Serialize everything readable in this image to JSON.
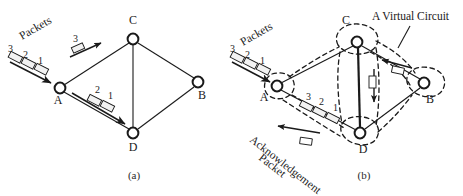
{
  "figure": {
    "title_visible": false,
    "panels": [
      {
        "id": "a",
        "caption": "(a)",
        "nodes": [
          {
            "name": "A",
            "label": "A",
            "cx": 60,
            "cy": 88,
            "lx": 58,
            "ly": 104
          },
          {
            "name": "B",
            "label": "B",
            "cx": 198,
            "cy": 82,
            "lx": 202,
            "ly": 99
          },
          {
            "name": "C",
            "label": "C",
            "cx": 133,
            "cy": 39,
            "lx": 133,
            "ly": 24
          },
          {
            "name": "D",
            "label": "D",
            "cx": 133,
            "cy": 133,
            "lx": 133,
            "ly": 151
          }
        ],
        "edges": [
          {
            "from": "A",
            "to": "C"
          },
          {
            "from": "C",
            "to": "B"
          },
          {
            "from": "A",
            "to": "D"
          },
          {
            "from": "D",
            "to": "B"
          },
          {
            "from": "C",
            "to": "D"
          }
        ],
        "annotations": [
          {
            "name": "packets-label",
            "text": "Packets",
            "x": 22,
            "y": 38,
            "rotate": -30
          }
        ],
        "packet_groups": [
          {
            "name": "packets-inbound-to-a",
            "numbers": [
              "3",
              "2",
              "1"
            ],
            "direction": "toward-A"
          },
          {
            "name": "packet-on-edge-a-c",
            "numbers": [
              "3"
            ],
            "direction": "A-to-C"
          },
          {
            "name": "packets-on-edge-a-d",
            "numbers": [
              "2",
              "1"
            ],
            "direction": "A-to-D"
          }
        ]
      },
      {
        "id": "b",
        "caption": "(b)",
        "nodes": [
          {
            "name": "A",
            "label": "A",
            "cx": 277,
            "cy": 86,
            "lx": 264,
            "ly": 100
          },
          {
            "name": "B",
            "label": "B",
            "cx": 424,
            "cy": 83,
            "lx": 430,
            "ly": 102
          },
          {
            "name": "C",
            "label": "C",
            "cx": 357,
            "cy": 42,
            "lx": 346,
            "ly": 23
          },
          {
            "name": "D",
            "label": "D",
            "cx": 360,
            "cy": 133,
            "lx": 363,
            "ly": 153
          }
        ],
        "edges": [
          {
            "from": "A",
            "to": "C"
          },
          {
            "from": "C",
            "to": "B"
          },
          {
            "from": "A",
            "to": "D"
          },
          {
            "from": "D",
            "to": "B"
          },
          {
            "from": "C",
            "to": "D"
          }
        ],
        "annotations": [
          {
            "name": "virtual-circuit-label",
            "text": "A Virtual Circuit",
            "x": 372,
            "y": 20,
            "rotate": 0
          },
          {
            "name": "packets-label",
            "text": "Packets",
            "x": 243,
            "y": 44,
            "rotate": -30
          },
          {
            "name": "acknowledgement-label-line1",
            "text": "Acknowledgement",
            "x": 248,
            "y": 140,
            "rotate": 38
          },
          {
            "name": "acknowledgement-label-line2",
            "text": "Packet",
            "x": 258,
            "y": 158,
            "rotate": 38
          }
        ],
        "packet_groups": [
          {
            "name": "packets-inbound-to-a",
            "numbers": [
              "3",
              "2",
              "1"
            ],
            "direction": "toward-A"
          },
          {
            "name": "packets-on-edge-a-d",
            "numbers": [
              "3",
              "2",
              "1"
            ],
            "direction": "A-to-D"
          },
          {
            "name": "ack-packet-on-edge-d-a",
            "numbers": [],
            "direction": "D-to-A"
          },
          {
            "name": "packet-on-edge-c-d",
            "numbers": [],
            "direction": "C-to-D"
          },
          {
            "name": "packet-on-edge-b-c",
            "numbers": [],
            "direction": "B-to-C"
          }
        ],
        "virtual_circuit": {
          "name": "virtual-circuit-outline",
          "style": "dashed",
          "path_nodes": [
            "A",
            "D",
            "B",
            "C"
          ]
        }
      }
    ],
    "colors": {
      "stroke": "#1a1a1a",
      "background": "#ffffff",
      "packet_fill": "#f2f2f2"
    }
  }
}
